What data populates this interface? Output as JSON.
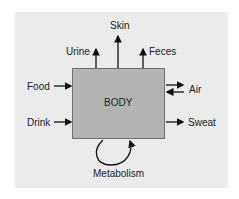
{
  "diagram": {
    "center": "BODY",
    "inputs": [
      "Food",
      "Drink",
      "Air"
    ],
    "outputs": [
      "Urine",
      "Skin",
      "Feces",
      "Air",
      "Sweat"
    ],
    "labels": {
      "skin": "Skin",
      "urine": "Urine",
      "feces": "Feces",
      "food": "Food",
      "air": "Air",
      "drink": "Drink",
      "sweat": "Sweat",
      "metabolism": "Metabolism",
      "body": "BODY"
    },
    "colors": {
      "panel": "#ebebeb",
      "box": "#b3b3b3",
      "arrow": "#111111"
    }
  }
}
